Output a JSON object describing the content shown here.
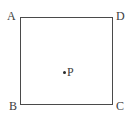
{
  "figure": {
    "type": "geometry-diagram",
    "background_color": "#ffffff",
    "stroke_color": "#4a4a4a",
    "label_color": "#3d3d3d",
    "point_color": "#2b2b2b"
  },
  "square": {
    "vertices": [
      {
        "id": "A",
        "label": "A",
        "position": "top-left"
      },
      {
        "id": "D",
        "label": "D",
        "position": "top-right"
      },
      {
        "id": "B",
        "label": "B",
        "position": "bottom-left"
      },
      {
        "id": "C",
        "label": "C",
        "position": "bottom-right"
      }
    ]
  },
  "interior_point": {
    "label": "P",
    "marker": "filled-dot"
  }
}
